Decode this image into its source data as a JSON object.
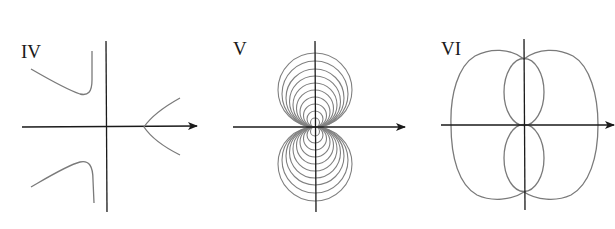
{
  "figure": {
    "panels": [
      {
        "id": "IV",
        "label": "IV",
        "description": "Hyperbola-like curve with three branches: two in left half-plane approaching a vertical asymptote left of the y-axis, and one opening rightward on the positive x-axis"
      },
      {
        "id": "V",
        "label": "V",
        "description": "Family of circles tangent to the x-axis at the origin, above and below"
      },
      {
        "id": "VI",
        "label": "VI",
        "description": "Polar curve with large outer peanut-shaped loop and two inner lobes along the y-axis"
      }
    ],
    "colors": {
      "axis": "#1a1a1a",
      "curve": "#7a7a7a",
      "background": "#ffffff"
    }
  }
}
